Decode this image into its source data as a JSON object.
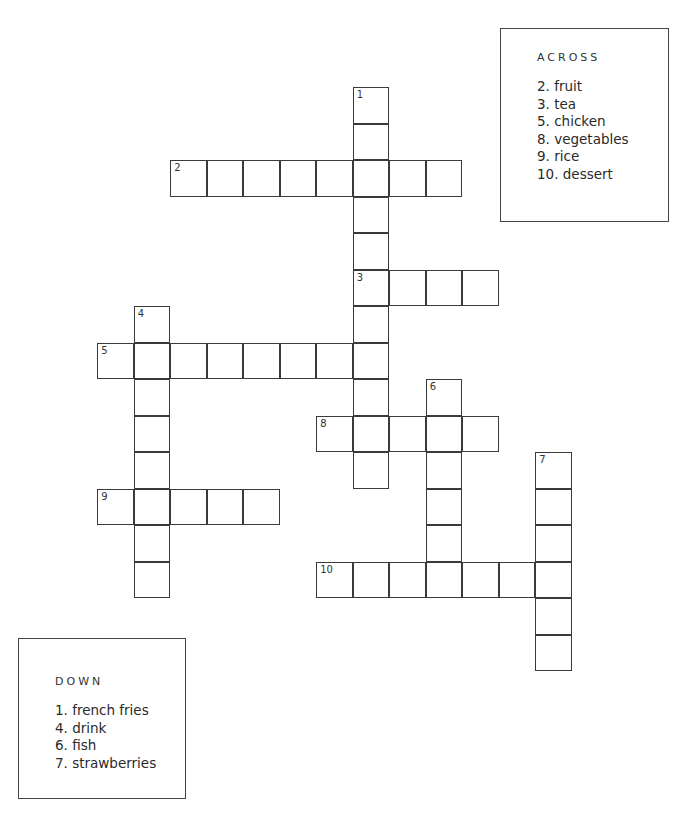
{
  "puzzle": {
    "grid": {
      "origin_x": 98,
      "origin_y": 88,
      "cell_size": 36.5,
      "entries": [
        {
          "number": "1",
          "direction": "down",
          "col": 7,
          "row": 0,
          "length": 11
        },
        {
          "number": "2",
          "direction": "across",
          "col": 2,
          "row": 2,
          "length": 8
        },
        {
          "number": "3",
          "direction": "across",
          "col": 7,
          "row": 5,
          "length": 4
        },
        {
          "number": "4",
          "direction": "down",
          "col": 1,
          "row": 6,
          "length": 8
        },
        {
          "number": "5",
          "direction": "across",
          "col": 0,
          "row": 7,
          "length": 8
        },
        {
          "number": "6",
          "direction": "down",
          "col": 9,
          "row": 8,
          "length": 6
        },
        {
          "number": "7",
          "direction": "down",
          "col": 12,
          "row": 10,
          "length": 6
        },
        {
          "number": "8",
          "direction": "across",
          "col": 6,
          "row": 9,
          "length": 5
        },
        {
          "number": "9",
          "direction": "across",
          "col": 0,
          "row": 11,
          "length": 5
        },
        {
          "number": "10",
          "direction": "across",
          "col": 6,
          "row": 13,
          "length": 7
        }
      ]
    },
    "across": {
      "heading": "ACROSS",
      "clues": [
        "2. fruit",
        "3. tea",
        "5. chicken",
        "8. vegetables",
        "9. rice",
        "10. dessert"
      ]
    },
    "down": {
      "heading": "DOWN",
      "clues": [
        "1. french fries",
        "4. drink",
        "6. fish",
        "7. strawberries"
      ]
    }
  }
}
